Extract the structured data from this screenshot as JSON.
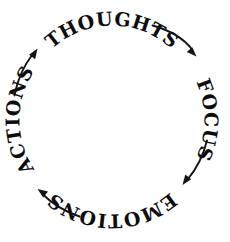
{
  "diagram": {
    "type": "cycle",
    "direction": "clockwise",
    "background_color": "#ffffff",
    "text_color": "#0d0d0d",
    "arrow_color": "#141414",
    "center": {
      "x": 112,
      "y": 120
    },
    "text_radius": 88,
    "arrow_radius": 94,
    "nodes": [
      {
        "id": "thoughts",
        "label": "THOUGHTS",
        "position": "top",
        "angle_deg": 270,
        "orientation": "upright-curved-outward"
      },
      {
        "id": "focus",
        "label": "FOCUS",
        "position": "right",
        "angle_deg": 0,
        "orientation": "rotated-clockwise-90"
      },
      {
        "id": "emotions",
        "label": "EMOTIONS",
        "position": "bottom",
        "angle_deg": 90,
        "orientation": "inverted"
      },
      {
        "id": "actions",
        "label": "ACTIONS",
        "position": "left",
        "angle_deg": 180,
        "orientation": "rotated-counterclockwise-90"
      }
    ],
    "arrows": [
      {
        "id": "thoughts-to-focus",
        "from": "thoughts",
        "to": "focus",
        "label": ""
      },
      {
        "id": "focus-to-emotions",
        "from": "focus",
        "to": "emotions",
        "label": ""
      },
      {
        "id": "emotions-to-actions",
        "from": "emotions",
        "to": "actions",
        "label": ""
      },
      {
        "id": "actions-to-thoughts",
        "from": "actions",
        "to": "thoughts",
        "label": ""
      }
    ]
  }
}
